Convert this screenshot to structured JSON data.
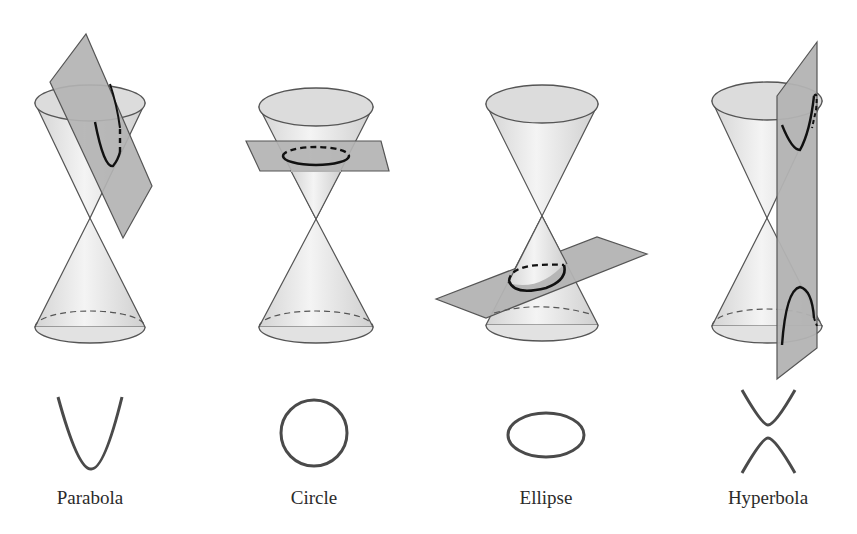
{
  "colors": {
    "background": "#ffffff",
    "cone_fill": "#e6e6e6",
    "cone_stroke": "#555555",
    "plane_fill": "#b5b5b5",
    "plane_stroke": "#555555",
    "curve": "#1a1a1a",
    "shape_stroke": "#4a4a4a",
    "label": "#2b2b2b"
  },
  "panels": [
    {
      "id": "parabola",
      "label": "Parabola",
      "plane": "tilted parallel to cone side, cutting upper nappe",
      "shape": "parabola"
    },
    {
      "id": "circle",
      "label": "Circle",
      "plane": "horizontal, cutting upper nappe",
      "shape": "circle"
    },
    {
      "id": "ellipse",
      "label": "Ellipse",
      "plane": "slightly tilted, cutting lower nappe",
      "shape": "ellipse"
    },
    {
      "id": "hyperbola",
      "label": "Hyperbola",
      "plane": "vertical, cutting both nappes",
      "shape": "hyperbola"
    }
  ]
}
